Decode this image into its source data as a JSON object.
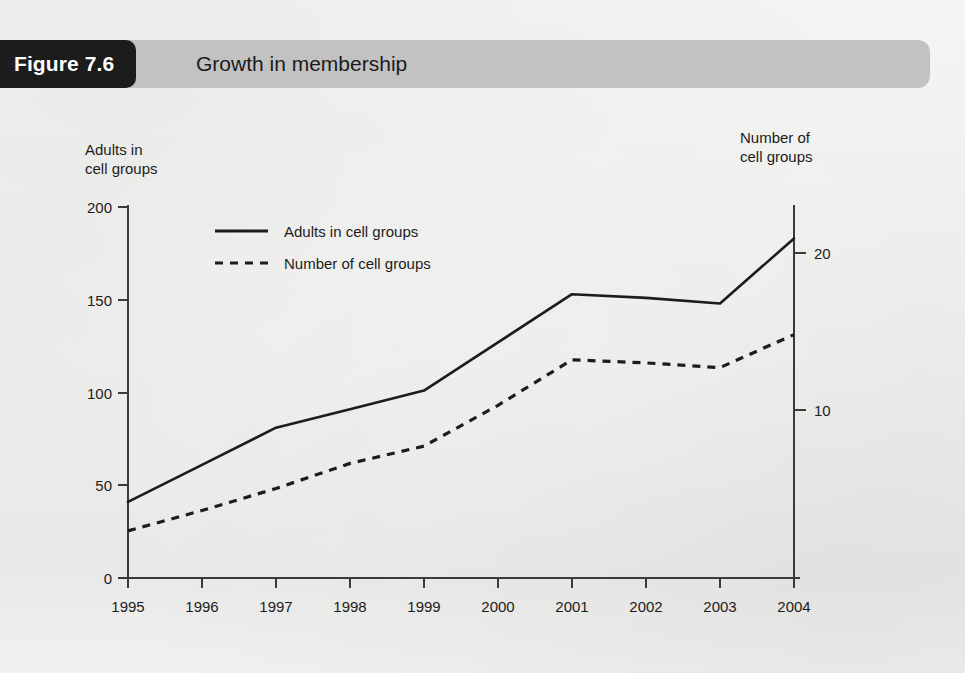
{
  "figure": {
    "tag": "Figure 7.6",
    "title": "Growth in membership"
  },
  "colors": {
    "tag_background": "#1c1c1c",
    "band_background": "#c2c2c2",
    "page_background": "#f2f2f0",
    "ink": "#1c1c1c",
    "axis": "#3a3a3a"
  },
  "chart_data": {
    "type": "line",
    "title": "Growth in membership",
    "xlabel": "",
    "ylabel": "Adults in cell groups",
    "y2label": "Number of cell groups",
    "grid": false,
    "legend_position": "upper-left-inside",
    "categories": [
      "1995",
      "1996",
      "1997",
      "1998",
      "1999",
      "2000",
      "2001",
      "2002",
      "2003",
      "2004"
    ],
    "ylim": [
      0,
      200
    ],
    "yticks": [
      0,
      50,
      100,
      150,
      200
    ],
    "y2lim": [
      0,
      22.3
    ],
    "y2ticks": [
      10,
      20
    ],
    "series": [
      {
        "name": "Adults in cell groups",
        "axis": "left",
        "style": "solid",
        "values": [
          41,
          61,
          81,
          91,
          101,
          127,
          153,
          151,
          148,
          183
        ]
      },
      {
        "name": "Number of cell groups",
        "axis": "right",
        "style": "dashed",
        "values": [
          2.3,
          3.6,
          5.0,
          6.6,
          7.7,
          10.3,
          13.2,
          13.0,
          12.7,
          14.8
        ]
      }
    ]
  },
  "axes": {
    "left_caption": "Adults in\ncell groups",
    "right_caption": "Number of\ncell groups",
    "left_ticks": [
      "200",
      "150",
      "100",
      "50",
      "0"
    ],
    "right_ticks": [
      "20",
      "10"
    ],
    "x_ticks": [
      "1995",
      "1996",
      "1997",
      "1998",
      "1999",
      "2000",
      "2001",
      "2002",
      "2003",
      "2004"
    ]
  },
  "legend": [
    {
      "label": "Adults in cell groups",
      "style": "solid"
    },
    {
      "label": "Number of cell groups",
      "style": "dashed"
    }
  ]
}
